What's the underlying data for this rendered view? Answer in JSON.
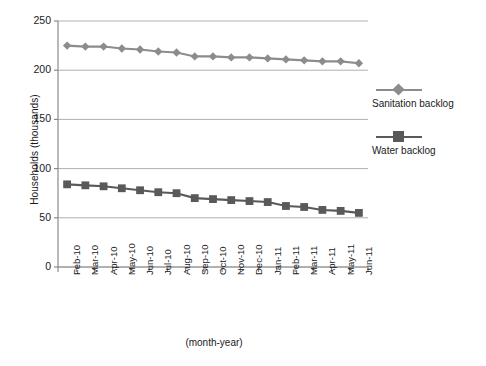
{
  "chart_data": {
    "type": "line",
    "title": "",
    "xlabel": "(month-year)",
    "ylabel": "Households (thousands)",
    "categories": [
      "Feb-10",
      "Mar-10",
      "Apr-10",
      "May-10",
      "Jun-10",
      "Jul-10",
      "Aug-10",
      "Sep-10",
      "Oct-10",
      "Nov-10",
      "Dec-10",
      "Jan-11",
      "Feb-11",
      "Mar-11",
      "Apr-11",
      "May-11",
      "Jun-11"
    ],
    "series": [
      {
        "name": "Sanitation backlog",
        "color": "#8c8c8c",
        "marker": "diamond",
        "values": [
          225,
          224,
          224,
          222,
          221,
          219,
          218,
          214,
          214,
          213,
          213,
          212,
          211,
          210,
          209,
          209,
          207
        ]
      },
      {
        "name": "Water backlog",
        "color": "#595959",
        "marker": "square",
        "values": [
          84,
          83,
          82,
          80,
          78,
          76,
          75,
          70,
          69,
          68,
          67,
          66,
          62,
          61,
          58,
          57,
          55
        ]
      }
    ],
    "ylim": [
      0,
      250
    ],
    "yticks": [
      0,
      50,
      100,
      150,
      200,
      250
    ],
    "grid": true,
    "legend_position": "right"
  },
  "legend": {
    "entries": [
      {
        "label": "Sanitation backlog"
      },
      {
        "label": "Water backlog"
      }
    ]
  },
  "axes": {
    "y_title": "Households (thousands)",
    "x_title": "(month-year)"
  }
}
